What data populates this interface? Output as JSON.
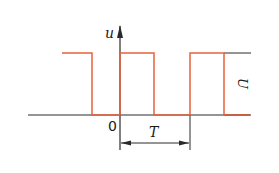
{
  "diagram": {
    "type": "square-wave",
    "axis_label_y": "u",
    "origin_label": "0",
    "period_label": "T",
    "amplitude_label": "U",
    "colors": {
      "waveform": "#e8623a",
      "axes": "#2a2a2a"
    },
    "waveform_points": [
      [
        62,
        53
      ],
      [
        92,
        53
      ],
      [
        92,
        115
      ],
      [
        120,
        115
      ],
      [
        120,
        53
      ],
      [
        154,
        53
      ],
      [
        154,
        115
      ],
      [
        190,
        115
      ],
      [
        190,
        53
      ],
      [
        224,
        53
      ],
      [
        224,
        115
      ],
      [
        250,
        115
      ]
    ]
  }
}
